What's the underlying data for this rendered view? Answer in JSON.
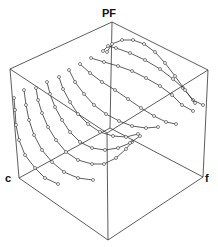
{
  "diagram": {
    "axes": {
      "vertical": "PF",
      "left": "c",
      "right": "f"
    },
    "colors": {
      "line": "#333333",
      "marker_fill": "#ffffff",
      "background": "#ffffff"
    },
    "cube": {
      "vertices": {
        "top": [
          112,
          22
        ],
        "left_top": [
          10,
          69
        ],
        "right_top": [
          208,
          70
        ],
        "left_bottom": [
          19,
          178
        ],
        "right_bottom": [
          203,
          177
        ],
        "bottom": [
          108,
          240
        ],
        "back": [
          110,
          128
        ],
        "front": [
          107,
          133
        ]
      },
      "edges": [
        [
          "top",
          "left_top"
        ],
        [
          "top",
          "right_top"
        ],
        [
          "left_top",
          "left_bottom"
        ],
        [
          "right_top",
          "right_bottom"
        ],
        [
          "left_bottom",
          "bottom"
        ],
        [
          "right_bottom",
          "bottom"
        ],
        [
          "top",
          "back"
        ],
        [
          "left_bottom",
          "back"
        ],
        [
          "right_bottom",
          "back"
        ],
        [
          "left_top",
          "front"
        ],
        [
          "right_top",
          "front"
        ],
        [
          "front",
          "bottom"
        ]
      ]
    },
    "curves": [
      [
        [
          14,
          98
        ],
        [
          15,
          110
        ],
        [
          16,
          125
        ],
        [
          19,
          140
        ],
        [
          25,
          155
        ],
        [
          35,
          168
        ],
        [
          45,
          178
        ],
        [
          58,
          184
        ]
      ],
      [
        [
          24,
          90
        ],
        [
          26,
          105
        ],
        [
          29,
          120
        ],
        [
          34,
          135
        ],
        [
          42,
          150
        ],
        [
          52,
          162
        ],
        [
          64,
          172
        ],
        [
          78,
          178
        ],
        [
          93,
          180
        ]
      ],
      [
        [
          36,
          88
        ],
        [
          38,
          100
        ],
        [
          42,
          113
        ],
        [
          48,
          127
        ],
        [
          56,
          140
        ],
        [
          66,
          152
        ],
        [
          78,
          160
        ],
        [
          92,
          164
        ],
        [
          104,
          164
        ],
        [
          116,
          158
        ],
        [
          126,
          149
        ],
        [
          132,
          142
        ]
      ],
      [
        [
          47,
          82
        ],
        [
          50,
          94
        ],
        [
          55,
          107
        ],
        [
          62,
          120
        ],
        [
          70,
          132
        ],
        [
          80,
          142
        ],
        [
          92,
          148
        ],
        [
          105,
          150
        ],
        [
          118,
          148
        ],
        [
          130,
          143
        ],
        [
          140,
          136
        ]
      ],
      [
        [
          59,
          77
        ],
        [
          63,
          89
        ],
        [
          70,
          102
        ],
        [
          78,
          114
        ],
        [
          88,
          124
        ],
        [
          100,
          132
        ],
        [
          113,
          136
        ],
        [
          126,
          137
        ],
        [
          138,
          134
        ]
      ],
      [
        [
          69,
          70
        ],
        [
          75,
          82
        ],
        [
          84,
          94
        ],
        [
          94,
          105
        ],
        [
          106,
          114
        ],
        [
          119,
          121
        ],
        [
          132,
          126
        ],
        [
          146,
          128
        ],
        [
          158,
          127
        ]
      ],
      [
        [
          80,
          64
        ],
        [
          90,
          73
        ],
        [
          102,
          82
        ],
        [
          115,
          90
        ],
        [
          128,
          99
        ],
        [
          141,
          108
        ],
        [
          154,
          116
        ],
        [
          166,
          122
        ],
        [
          176,
          124
        ]
      ],
      [
        [
          91,
          58
        ],
        [
          104,
          62
        ],
        [
          118,
          66
        ],
        [
          132,
          71
        ],
        [
          146,
          78
        ],
        [
          160,
          86
        ],
        [
          172,
          95
        ],
        [
          182,
          105
        ],
        [
          193,
          111
        ]
      ],
      [
        [
          103,
          51
        ],
        [
          108,
          46
        ],
        [
          116,
          48
        ],
        [
          130,
          53
        ],
        [
          145,
          60
        ],
        [
          160,
          69
        ],
        [
          173,
          79
        ],
        [
          183,
          88
        ],
        [
          193,
          100
        ],
        [
          203,
          105
        ]
      ],
      [
        [
          107,
          52
        ],
        [
          112,
          44
        ],
        [
          122,
          40
        ],
        [
          133,
          40
        ],
        [
          144,
          44
        ],
        [
          155,
          52
        ],
        [
          165,
          63
        ],
        [
          175,
          76
        ],
        [
          185,
          90
        ],
        [
          195,
          103
        ]
      ]
    ]
  }
}
